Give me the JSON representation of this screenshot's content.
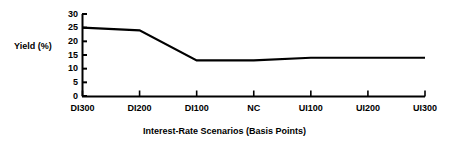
{
  "chart_data": {
    "type": "line",
    "title": "",
    "subtitle": "",
    "xlabel": "Interest-Rate Scenarios (Basis Points)",
    "ylabel": "Yield (%)",
    "categories": [
      "DI300",
      "DI200",
      "DI100",
      "NC",
      "UI100",
      "UI200",
      "UI300"
    ],
    "values": [
      25,
      24,
      13,
      13,
      14,
      14,
      14
    ],
    "series": [
      {
        "name": "Yield",
        "values": [
          25,
          24,
          13,
          13,
          14,
          14,
          14
        ]
      }
    ],
    "yticks": [
      0,
      5,
      10,
      15,
      20,
      25,
      30
    ],
    "ytick_labels": [
      "0",
      "5",
      "10",
      "15",
      "20",
      "25",
      "30"
    ],
    "ylim": [
      0,
      30
    ],
    "grid": false,
    "legend": false,
    "legend_position": "none",
    "line_color": "#000000",
    "axis_color": "#000000",
    "background_color": "#ffffff"
  },
  "axes": {
    "y_label_text": "Yield (%)",
    "x_title_text": "Interest-Rate Scenarios (Basis Points)"
  }
}
